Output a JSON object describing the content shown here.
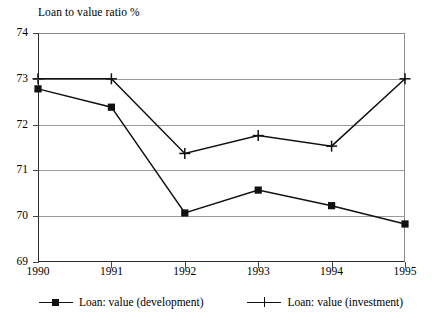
{
  "chart_data": {
    "type": "line",
    "title": "Loan to value ratio %",
    "xlabel": "",
    "ylabel": "",
    "categories": [
      "1990",
      "1991",
      "1992",
      "1993",
      "1994",
      "1995"
    ],
    "x": [
      1990,
      1991,
      1992,
      1993,
      1994,
      1995
    ],
    "series": [
      {
        "name": "Loan: value (development)",
        "marker": "filled-square",
        "color": "#111111",
        "values": [
          72.78,
          72.38,
          70.07,
          70.57,
          70.23,
          69.83
        ]
      },
      {
        "name": "Loan: value (investment)",
        "marker": "plus",
        "color": "#111111",
        "values": [
          73.0,
          73.0,
          71.37,
          71.76,
          71.53,
          73.0
        ]
      }
    ],
    "ylim": [
      69,
      74
    ],
    "yticks": [
      69,
      70,
      71,
      72,
      73,
      74
    ],
    "ytick_labels": [
      "69",
      "70",
      "71",
      "72",
      "73",
      "74"
    ],
    "xlim": [
      1990,
      1995
    ],
    "grid": "horizontal",
    "legend_position": "bottom"
  },
  "legend": {
    "entries": [
      {
        "label": "Loan: value (development)"
      },
      {
        "label": "Loan: value (investment)"
      }
    ]
  }
}
